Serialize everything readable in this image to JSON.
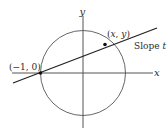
{
  "diagram": {
    "axes": {
      "x_label": "x",
      "y_label": "y"
    },
    "circle": {
      "description": "unit circle centered at origin"
    },
    "points": [
      {
        "label": "(−1, 0)"
      },
      {
        "label": "(x, y)"
      }
    ],
    "line": {
      "label": "Slope t"
    },
    "colors": {
      "stroke": "#2a2a2a",
      "circle": "#555555",
      "axis": "#555555",
      "background": "#ffffff"
    }
  }
}
